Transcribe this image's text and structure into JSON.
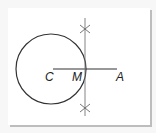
{
  "diagram": {
    "type": "geometric-construction",
    "points": [
      {
        "label": "C",
        "x": 53,
        "y": 69
      },
      {
        "label": "M",
        "x": 85,
        "y": 69
      },
      {
        "label": "A",
        "x": 117,
        "y": 69
      }
    ],
    "circle": {
      "center": "C",
      "cx": 51,
      "cy": 69,
      "r": 35
    },
    "segment": {
      "from": "C",
      "to": "A"
    },
    "bisector": {
      "x": 85,
      "y_top": 18,
      "y_bottom": 116
    },
    "arc_marks": [
      {
        "x": 85,
        "y": 29
      },
      {
        "x": 85,
        "y": 108
      }
    ],
    "colors": {
      "stroke": "#333333",
      "bisector": "#777777",
      "background": "#ffffff"
    }
  }
}
